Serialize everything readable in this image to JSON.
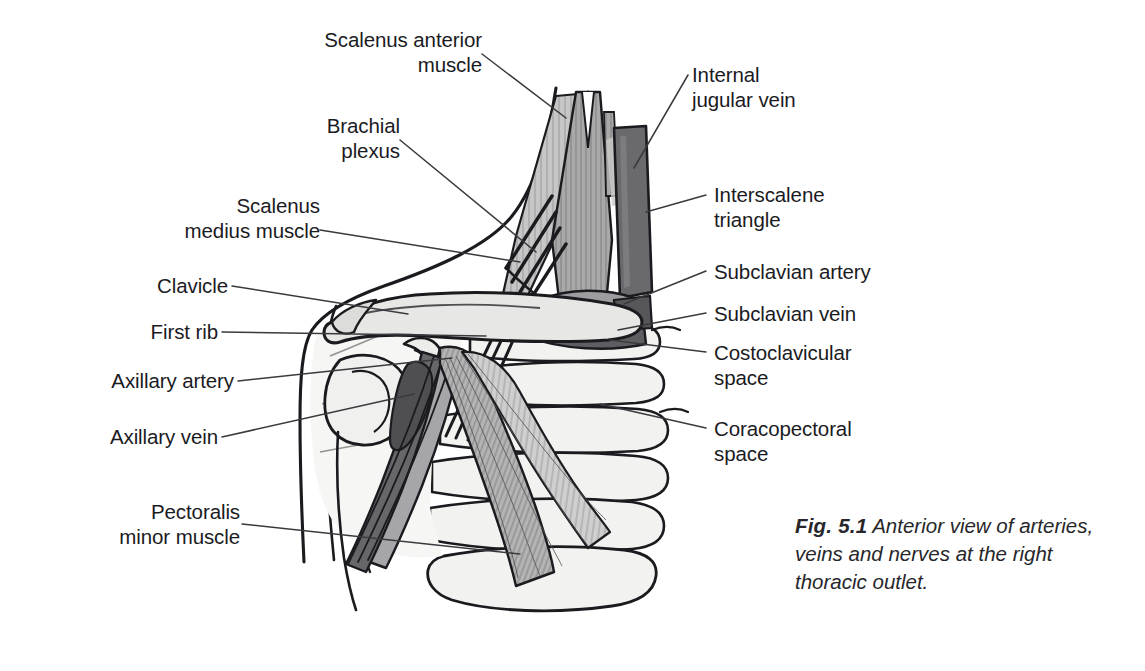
{
  "figure": {
    "caption_number": "Fig. 5.1",
    "caption_text": "Anterior view of arteries, veins and nerves at the right thoracic outlet.",
    "alt": "Anterior view of the right thoracic outlet showing scalene muscles, brachial plexus, clavicle, first rib, subclavian and axillary vessels, ribs and pectoralis minor muscle."
  },
  "labels": {
    "scalenus_anterior": "Scalenus anterior\nmuscle",
    "brachial_plexus": "Brachial\nplexus",
    "scalenus_medius": "Scalenus\nmedius muscle",
    "clavicle": "Clavicle",
    "first_rib": "First rib",
    "axillary_artery": "Axillary artery",
    "axillary_vein": "Axillary vein",
    "pectoralis_minor": "Pectoralis\nminor muscle",
    "internal_jugular": "Internal\njugular vein",
    "interscalene_triangle": "Interscalene\ntriangle",
    "subclavian_artery": "Subclavian artery",
    "subclavian_vein": "Subclavian vein",
    "costoclavicular_space": "Costoclavicular\nspace",
    "coracopectoral_space": "Coracopectoral\nspace"
  },
  "colors": {
    "ink": "#1b1b1f",
    "leader_line": "#3a3a3e",
    "bone_light": "#f0f0ee",
    "bone_mid": "#dedede",
    "muscle_gray": "#a9a9a9",
    "muscle_light": "#c3c3c3",
    "vessel_dark": "#6f6f73",
    "vessel_darker": "#4e4e52",
    "background": "#ffffff"
  }
}
